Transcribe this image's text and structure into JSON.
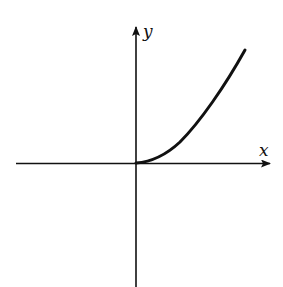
{
  "diagram": {
    "type": "function-graph",
    "axes": {
      "x_label": "x",
      "y_label": "y"
    },
    "curve": {
      "description": "curve starting at origin, increasing, concave up then nearly linear, only for x >= 0",
      "domain": "x >= 0"
    },
    "colors": {
      "stroke": "#111111",
      "background": "#ffffff"
    }
  }
}
